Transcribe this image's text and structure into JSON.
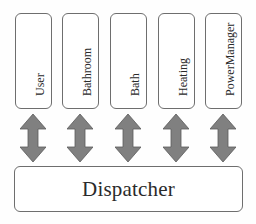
{
  "diagram": {
    "type": "architecture",
    "modules": [
      {
        "label": "User"
      },
      {
        "label": "Bathroom"
      },
      {
        "label": "Bath"
      },
      {
        "label": "Heating"
      },
      {
        "label": "PowerManager"
      }
    ],
    "connector": {
      "shape": "double-headed-vertical-arrow",
      "color": "#808080",
      "count": 5
    },
    "hub": {
      "label": "Dispatcher"
    },
    "colors": {
      "box_border": "#6e6e6e",
      "box_fill": "#ffffff",
      "arrow_fill": "#808080",
      "arrow_stroke": "#5a5a5a",
      "text": "#2a2a2a"
    }
  }
}
